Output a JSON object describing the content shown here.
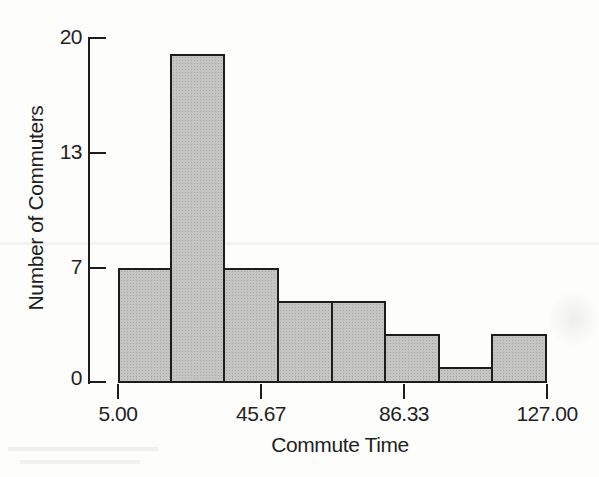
{
  "figure": {
    "background": "#fdfdfc",
    "text_color": "#1f1f1f"
  },
  "chart_data": {
    "type": "bar",
    "subtype": "histogram",
    "title": "",
    "xlabel": "Commute Time",
    "ylabel": "Number of Commuters",
    "values": [
      7,
      19,
      7,
      5,
      5,
      3,
      1,
      3
    ],
    "bin_edges": [
      5.0,
      20.25,
      35.5,
      50.75,
      66.0,
      81.25,
      96.5,
      111.75,
      127.0
    ],
    "x_tick_labels": [
      "5.00",
      "45.67",
      "86.33",
      "127.00"
    ],
    "y_tick_labels": [
      "0",
      "7",
      "13",
      "20"
    ],
    "y_tick_values": [
      0,
      7,
      13,
      20
    ],
    "xlim": [
      5.0,
      127.0
    ],
    "ylim": [
      0,
      20
    ],
    "grid": false,
    "legend": false,
    "bar_fill": "#c5c6c4",
    "bar_border": "#1d1d1d",
    "axis_color": "#1d1d1d"
  }
}
